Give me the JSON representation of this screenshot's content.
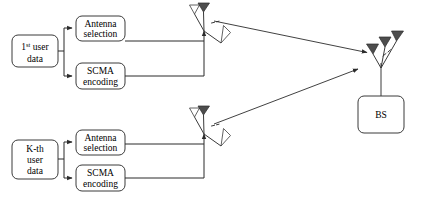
{
  "figure": {
    "type": "block-diagram",
    "background_color": "#ffffff",
    "line_color": "#2b2b2b",
    "box_fill": "#ffffff",
    "antenna_dark_fill": "#4d4d4d",
    "antenna_light_fill": "#ffffff"
  },
  "users": [
    {
      "id": "user-1",
      "source_label_main": "user",
      "source_label_index": "1",
      "source_label_sup": "st",
      "source_label_tail": "data",
      "blocks": [
        {
          "id": "antenna-selection-1",
          "line1": "Antenna",
          "line2": "selection"
        },
        {
          "id": "scma-encoding-1",
          "line1": "SCMA",
          "line2": "encoding"
        }
      ],
      "antenna_group": {
        "id": "user-1-antenna-array",
        "elements": [
          "antenna-outline",
          "antenna-filled",
          "antenna-outline"
        ],
        "ellipsis": "..."
      }
    },
    {
      "id": "user-k",
      "source_label_index": "K",
      "source_label_sup": "-th",
      "source_label_main": "user",
      "source_label_tail": "data",
      "blocks": [
        {
          "id": "antenna-selection-k",
          "line1": "Antenna",
          "line2": "selection"
        },
        {
          "id": "scma-encoding-k",
          "line1": "SCMA",
          "line2": "encoding"
        }
      ],
      "antenna_group": {
        "id": "user-k-antenna-array",
        "elements": [
          "antenna-outline",
          "antenna-filled",
          "antenna-outline"
        ],
        "ellipsis": "..."
      }
    }
  ],
  "base_station": {
    "id": "base-station",
    "label": "BS",
    "antenna_group": {
      "id": "bs-antenna-array",
      "elements": [
        "antenna-filled",
        "antenna-filled",
        "antenna-filled"
      ],
      "ellipsis": "..."
    }
  },
  "links": [
    {
      "id": "uplink-user-1-to-bs",
      "from": "user-1-antenna-array",
      "to": "bs-antenna-array",
      "style": "arrow"
    },
    {
      "id": "uplink-user-k-to-bs",
      "from": "user-k-antenna-array",
      "to": "bs-antenna-array",
      "style": "arrow"
    }
  ]
}
